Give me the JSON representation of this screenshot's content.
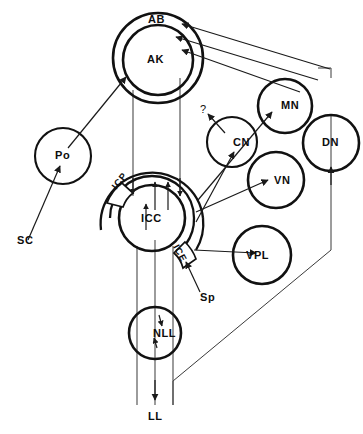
{
  "figure": {
    "background_color": "#ffffff",
    "line_color": "#111111",
    "connector_color": "#3a3a3a"
  },
  "nodes": {
    "ab": {
      "label": "AB",
      "name": "auditory-belt-cortex"
    },
    "ak": {
      "label": "AK",
      "name": "auditory-koniocortex"
    },
    "po": {
      "label": "Po",
      "name": "posterior-thalamic-nucleus"
    },
    "cn": {
      "label": "CN",
      "name": "cochlear-nucleus"
    },
    "mn": {
      "label": "MN",
      "name": "medial-geniculate-nucleus"
    },
    "vn": {
      "label": "VN",
      "name": "ventral-nucleus"
    },
    "dn": {
      "label": "DN",
      "name": "dorsal-nucleus"
    },
    "vpl": {
      "label": "VPL",
      "name": "ventral-posterolateral-nucleus"
    },
    "icc": {
      "label": "ICC",
      "name": "inferior-colliculus-central-nucleus"
    },
    "icp": {
      "label": "ICP",
      "name": "inferior-colliculus-pericentral-nucleus"
    },
    "ice": {
      "label": "ICE",
      "name": "inferior-colliculus-external-nucleus"
    },
    "nll": {
      "label": "NLL",
      "name": "nucleus-of-lateral-lemniscus"
    }
  },
  "annotations": {
    "sc": {
      "label": "SC",
      "name": "superior-colliculus-source"
    },
    "sp": {
      "label": "Sp",
      "name": "spinal-input"
    },
    "ll": {
      "label": "LL",
      "name": "lateral-lemniscus"
    },
    "unknown": {
      "label": "?",
      "name": "unknown-projection"
    }
  }
}
